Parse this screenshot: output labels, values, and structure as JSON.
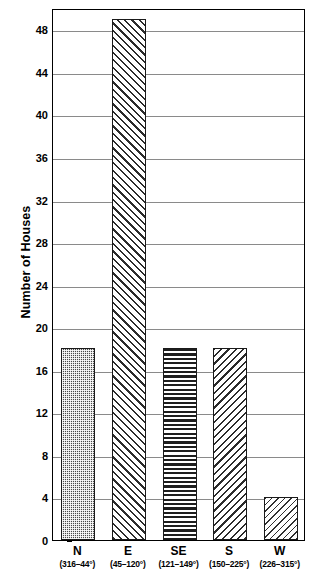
{
  "chart_data": {
    "type": "bar",
    "title": "",
    "subtitle": "",
    "xlabel": "",
    "ylabel": "Number of Houses",
    "categories": [
      "N",
      "E",
      "SE",
      "S",
      "W"
    ],
    "category_sublabels": [
      "(316–44°)",
      "(45–120°)",
      "(121–149°)",
      "(150–225°)",
      "(226–315°)"
    ],
    "values": [
      18,
      49,
      18,
      18,
      4
    ],
    "series": [
      {
        "name": "Number of Houses",
        "values": [
          18,
          49,
          18,
          18,
          4
        ]
      }
    ],
    "bars": [
      {
        "category": "N",
        "sublabel": "(316–44°)",
        "value": 18,
        "pattern": "checkered-dots"
      },
      {
        "category": "E",
        "sublabel": "(45–120°)",
        "value": 49,
        "pattern": "forward-diagonal-hatch"
      },
      {
        "category": "SE",
        "sublabel": "(121–149°)",
        "value": 18,
        "pattern": "horizontal-stripes"
      },
      {
        "category": "S",
        "sublabel": "(150–225°)",
        "value": 18,
        "pattern": "backward-diagonal-hatch"
      },
      {
        "category": "W",
        "sublabel": "(226–315°)",
        "value": 4,
        "pattern": "fine-diagonal-dots"
      }
    ],
    "ylim": [
      0,
      50
    ],
    "ytick_values": [
      0,
      4,
      8,
      12,
      16,
      20,
      24,
      28,
      32,
      36,
      40,
      44,
      48
    ],
    "ytick_labels": [
      "0",
      "4",
      "8",
      "12",
      "16",
      "20",
      "24",
      "28",
      "32",
      "36",
      "40",
      "44",
      "48"
    ],
    "grid": true,
    "grid_axis": "y",
    "legend": false,
    "legend_position": "none",
    "frame": true,
    "colors": {
      "background": "#ffffff",
      "axis": "#000000",
      "grid": "#8a8a8a",
      "bar_outline": "#1a1a1a",
      "bar_fill_dark": "#4a4a4a",
      "bar_fill_hatch": "#2b2b2b",
      "text": "#000000"
    }
  }
}
